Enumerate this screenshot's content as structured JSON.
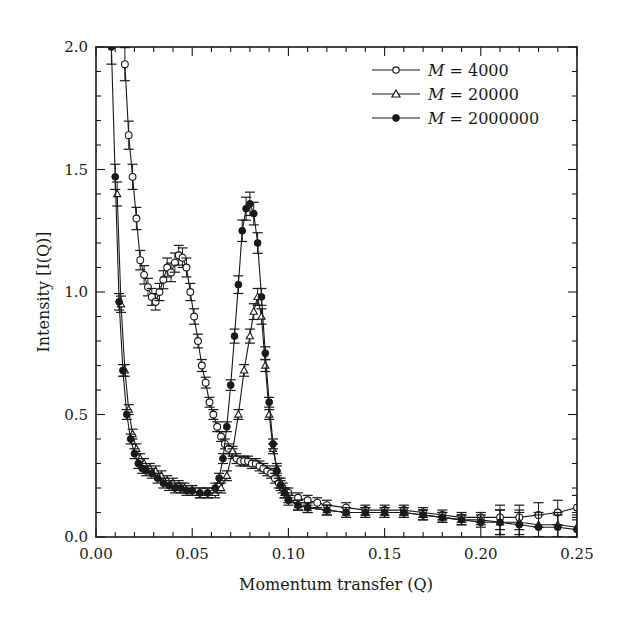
{
  "chart_data": {
    "type": "line",
    "title": "",
    "xlabel": "Momentum transfer (Q)",
    "ylabel": "Intensity [I(Q)]",
    "xlim": [
      0.0,
      0.25
    ],
    "ylim": [
      0.0,
      2.0
    ],
    "x_ticks": [
      "0.00",
      "0.05",
      "0.10",
      "0.15",
      "0.20",
      "0.25"
    ],
    "y_ticks": [
      "0.0",
      "0.5",
      "1.0",
      "1.5",
      "2.0"
    ],
    "grid": false,
    "legend_position": "upper right",
    "error_bars": true,
    "series": [
      {
        "name": "M = 4000",
        "marker": "open-circle",
        "x": [
          0.015,
          0.017,
          0.019,
          0.021,
          0.023,
          0.025,
          0.027,
          0.029,
          0.031,
          0.033,
          0.035,
          0.037,
          0.039,
          0.041,
          0.043,
          0.045,
          0.047,
          0.049,
          0.051,
          0.053,
          0.055,
          0.057,
          0.059,
          0.061,
          0.063,
          0.065,
          0.067,
          0.069,
          0.071,
          0.073,
          0.075,
          0.077,
          0.079,
          0.081,
          0.083,
          0.085,
          0.087,
          0.089,
          0.091,
          0.093,
          0.095,
          0.097,
          0.1,
          0.105,
          0.11,
          0.115,
          0.12,
          0.13,
          0.14,
          0.15,
          0.16,
          0.17,
          0.18,
          0.19,
          0.2,
          0.21,
          0.22,
          0.23,
          0.24,
          0.25
        ],
        "values": [
          1.93,
          1.64,
          1.47,
          1.3,
          1.13,
          1.07,
          1.02,
          0.98,
          0.96,
          1.0,
          1.05,
          1.1,
          1.08,
          1.12,
          1.15,
          1.14,
          1.1,
          1.0,
          0.9,
          0.8,
          0.7,
          0.63,
          0.55,
          0.5,
          0.45,
          0.41,
          0.38,
          0.36,
          0.34,
          0.32,
          0.31,
          0.31,
          0.31,
          0.3,
          0.3,
          0.29,
          0.28,
          0.27,
          0.26,
          0.24,
          0.22,
          0.2,
          0.18,
          0.16,
          0.15,
          0.14,
          0.13,
          0.12,
          0.11,
          0.11,
          0.11,
          0.1,
          0.09,
          0.08,
          0.08,
          0.08,
          0.08,
          0.09,
          0.1,
          0.12
        ]
      },
      {
        "name": "M = 20000",
        "marker": "open-triangle",
        "x": [
          0.011,
          0.013,
          0.015,
          0.017,
          0.019,
          0.021,
          0.023,
          0.025,
          0.028,
          0.031,
          0.034,
          0.037,
          0.04,
          0.043,
          0.046,
          0.05,
          0.054,
          0.058,
          0.062,
          0.065,
          0.068,
          0.071,
          0.074,
          0.077,
          0.08,
          0.082,
          0.084,
          0.086,
          0.088,
          0.09,
          0.092,
          0.094,
          0.096,
          0.098,
          0.1,
          0.105,
          0.11,
          0.12,
          0.13,
          0.14,
          0.15,
          0.16,
          0.17,
          0.18,
          0.19,
          0.2,
          0.21,
          0.22,
          0.23,
          0.24,
          0.25
        ],
        "values": [
          1.4,
          0.95,
          0.68,
          0.52,
          0.42,
          0.36,
          0.32,
          0.3,
          0.28,
          0.27,
          0.25,
          0.23,
          0.22,
          0.21,
          0.2,
          0.19,
          0.18,
          0.18,
          0.18,
          0.2,
          0.25,
          0.35,
          0.5,
          0.68,
          0.82,
          0.92,
          0.98,
          0.9,
          0.7,
          0.5,
          0.36,
          0.28,
          0.22,
          0.18,
          0.16,
          0.13,
          0.12,
          0.11,
          0.1,
          0.1,
          0.1,
          0.1,
          0.09,
          0.08,
          0.07,
          0.07,
          0.06,
          0.06,
          0.05,
          0.05,
          0.04
        ]
      },
      {
        "name": "M = 2000000",
        "marker": "filled-circle",
        "x": [
          0.008,
          0.01,
          0.012,
          0.014,
          0.016,
          0.018,
          0.02,
          0.022,
          0.024,
          0.026,
          0.029,
          0.032,
          0.035,
          0.038,
          0.041,
          0.044,
          0.047,
          0.05,
          0.054,
          0.058,
          0.062,
          0.064,
          0.066,
          0.068,
          0.07,
          0.072,
          0.074,
          0.076,
          0.078,
          0.08,
          0.082,
          0.084,
          0.086,
          0.088,
          0.09,
          0.092,
          0.094,
          0.096,
          0.098,
          0.1,
          0.105,
          0.11,
          0.12,
          0.13,
          0.14,
          0.15,
          0.16,
          0.17,
          0.18,
          0.19,
          0.2,
          0.21,
          0.22,
          0.23,
          0.24,
          0.25
        ],
        "values": [
          2.0,
          1.47,
          0.96,
          0.68,
          0.5,
          0.4,
          0.34,
          0.3,
          0.28,
          0.27,
          0.26,
          0.24,
          0.22,
          0.21,
          0.2,
          0.2,
          0.19,
          0.19,
          0.18,
          0.18,
          0.2,
          0.24,
          0.32,
          0.45,
          0.62,
          0.82,
          1.03,
          1.25,
          1.34,
          1.36,
          1.32,
          1.2,
          0.98,
          0.75,
          0.55,
          0.38,
          0.27,
          0.21,
          0.18,
          0.15,
          0.13,
          0.12,
          0.11,
          0.1,
          0.1,
          0.1,
          0.1,
          0.09,
          0.08,
          0.07,
          0.06,
          0.06,
          0.05,
          0.04,
          0.04,
          0.03
        ]
      }
    ]
  },
  "legend": {
    "items": [
      {
        "label_var": "M",
        "label_value": " = 4000"
      },
      {
        "label_var": "M",
        "label_value": " = 20000"
      },
      {
        "label_var": "M",
        "label_value": " = 2000000"
      }
    ]
  },
  "colors": {
    "ink": "#1a1a1a",
    "background": "#ffffff"
  }
}
